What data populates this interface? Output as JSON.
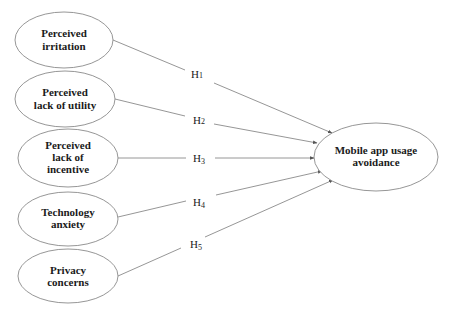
{
  "diagram": {
    "type": "path-model",
    "colors": {
      "line": "#8a8a8a",
      "text": "#1a1a1a",
      "background": "#ffffff"
    },
    "outcome": {
      "id": "avoidance",
      "lines": [
        "Mobile app usage",
        "avoidance"
      ]
    },
    "predictors": [
      {
        "id": "irritation",
        "lines": [
          "Perceived",
          "irritation"
        ]
      },
      {
        "id": "utility",
        "lines": [
          "Perceived",
          "lack of utility"
        ]
      },
      {
        "id": "incentive",
        "lines": [
          "Perceived",
          "lack of",
          "incentive"
        ]
      },
      {
        "id": "anxiety",
        "lines": [
          "Technology",
          "anxiety"
        ]
      },
      {
        "id": "privacy",
        "lines": [
          "Privacy",
          "concerns"
        ]
      }
    ],
    "hypotheses": [
      {
        "label": "H1",
        "base": "H",
        "sub": "1",
        "from": "irritation",
        "to": "avoidance"
      },
      {
        "label": "H2",
        "base": "H",
        "sub": "2",
        "from": "utility",
        "to": "avoidance"
      },
      {
        "label": "H3",
        "base": "H",
        "sub": "3",
        "from": "incentive",
        "to": "avoidance"
      },
      {
        "label": "H4",
        "base": "H",
        "sub": "4",
        "from": "anxiety",
        "to": "avoidance"
      },
      {
        "label": "H5",
        "base": "H",
        "sub": "5",
        "from": "privacy",
        "to": "avoidance"
      }
    ]
  }
}
